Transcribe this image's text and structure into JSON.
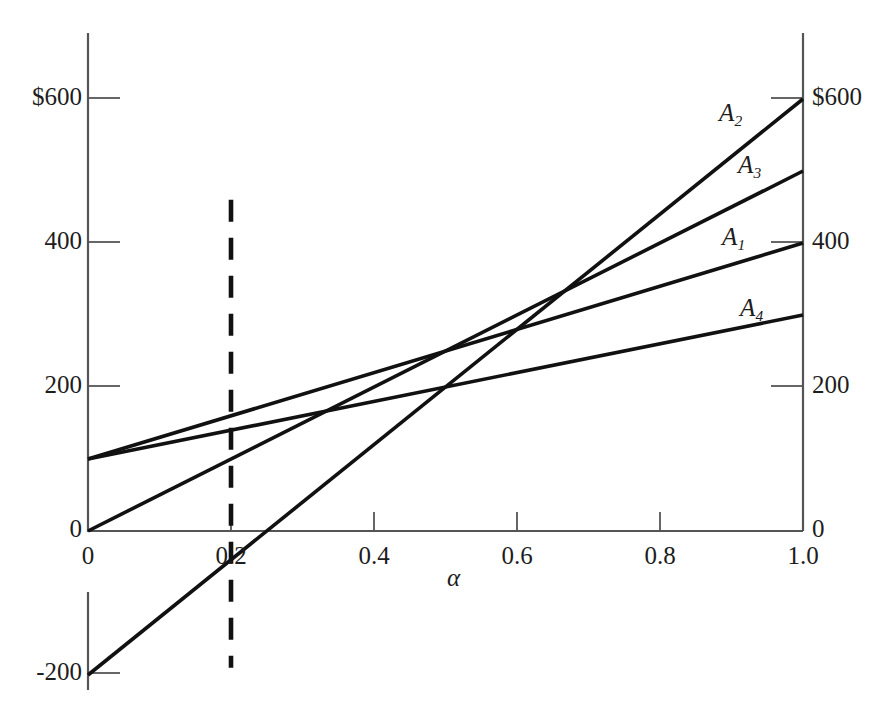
{
  "chart_data": {
    "type": "line",
    "title": "",
    "xlabel": "α",
    "ylabel": "",
    "xlim": [
      0,
      1.0
    ],
    "ylim": [
      -200,
      650
    ],
    "grid": false,
    "legend_position": "inline-right-of-line-ends",
    "x_ticks": [
      {
        "value": 0,
        "label": "0"
      },
      {
        "value": 0.2,
        "label": "0.2"
      },
      {
        "value": 0.4,
        "label": "0.4"
      },
      {
        "value": 0.6,
        "label": "0.6"
      },
      {
        "value": 0.8,
        "label": "0.8"
      },
      {
        "value": 1.0,
        "label": "1.0"
      }
    ],
    "y_ticks_left": [
      {
        "value": -200,
        "label": "-200"
      },
      {
        "value": 0,
        "label": "0"
      },
      {
        "value": 200,
        "label": "200"
      },
      {
        "value": 400,
        "label": "400"
      },
      {
        "value": 600,
        "label": "$600"
      }
    ],
    "y_ticks_right": [
      {
        "value": 0,
        "label": "0"
      },
      {
        "value": 200,
        "label": "200"
      },
      {
        "value": 400,
        "label": "400"
      },
      {
        "value": 600,
        "label": "$600"
      }
    ],
    "series": [
      {
        "name": "A1",
        "label": "A",
        "subscript": "1",
        "x": [
          0,
          1.0
        ],
        "values": [
          100,
          400
        ],
        "intercept": 100,
        "slope": 300,
        "color": "#111111"
      },
      {
        "name": "A2",
        "label": "A",
        "subscript": "2",
        "x": [
          0,
          1.0
        ],
        "values": [
          -200,
          600
        ],
        "intercept": -200,
        "slope": 800,
        "color": "#111111"
      },
      {
        "name": "A3",
        "label": "A",
        "subscript": "3",
        "x": [
          0,
          1.0
        ],
        "values": [
          0,
          500
        ],
        "intercept": 0,
        "slope": 500,
        "color": "#111111"
      },
      {
        "name": "A4",
        "label": "A",
        "subscript": "4",
        "x": [
          0,
          1.0
        ],
        "values": [
          100,
          300
        ],
        "intercept": 100,
        "slope": 200,
        "color": "#111111"
      }
    ],
    "annotations": [
      {
        "name": "alpha-reference-line",
        "type": "vertical-dashed-line",
        "x": 0.2,
        "y_from": 460,
        "y_to": -190,
        "label": "",
        "color": "#111111"
      }
    ]
  },
  "axis": {
    "left_axis_color": "#555555",
    "right_axis_color": "#555555",
    "x_axis_color": "#555555",
    "line_color": "#111111"
  }
}
